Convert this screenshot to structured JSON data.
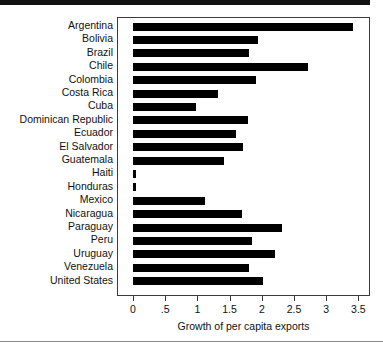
{
  "chart_data": {
    "type": "bar",
    "orientation": "horizontal",
    "title": "",
    "subtitle": "",
    "xlabel": "Growth of per capita exports",
    "ylabel": "",
    "xlim": [
      0,
      3.6
    ],
    "grid": false,
    "legend": null,
    "bar_color": "#000000",
    "frame_color": "#3b3b3b",
    "xticks": [
      0,
      0.5,
      1,
      1.5,
      2,
      2.5,
      3,
      3.5
    ],
    "xtick_labels": [
      "0",
      ".5",
      "1",
      "1.5",
      "2",
      "2.5",
      "3",
      "3.5"
    ],
    "categories": [
      "Argentina",
      "Bolivia",
      "Brazil",
      "Chile",
      "Colombia",
      "Costa Rica",
      "Cuba",
      "Dominican Republic",
      "Ecuador",
      "El Salvador",
      "Guatemala",
      "Haiti",
      "Honduras",
      "Mexico",
      "Nicaragua",
      "Paraguay",
      "Peru",
      "Uruguay",
      "Venezuela",
      "United States"
    ],
    "values": [
      3.42,
      1.94,
      1.8,
      2.72,
      1.91,
      1.32,
      0.98,
      1.79,
      1.6,
      1.71,
      1.41,
      0.05,
      0.05,
      1.12,
      1.69,
      2.31,
      1.85,
      2.21,
      1.8,
      2.02
    ]
  },
  "decorations": {
    "top_rule_color": "#111111",
    "bottom_rule_color": "#8a8a8a"
  }
}
